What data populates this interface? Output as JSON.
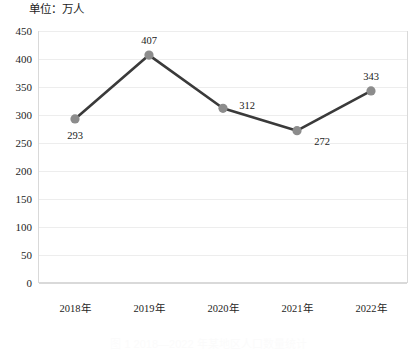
{
  "chart_data": {
    "type": "line",
    "title": "单位：万人",
    "xlabel": "",
    "ylabel": "",
    "categories": [
      "2018年",
      "2019年",
      "2020年",
      "2021年",
      "2022年"
    ],
    "values": [
      293,
      407,
      312,
      272,
      343
    ],
    "point_labels": [
      "293",
      "407",
      "312",
      "272",
      "343"
    ],
    "ylim": [
      0,
      450
    ],
    "ytick_values": [
      450,
      400,
      350,
      300,
      250,
      200,
      150,
      100,
      50,
      0
    ],
    "ytick_labels": [
      "450",
      "400",
      "350",
      "300",
      "250",
      "200",
      "150",
      "100",
      "50",
      "0"
    ],
    "grid": true,
    "legend": "none",
    "line_color": "#3a3a3a",
    "marker_color": "#8c8c8c",
    "gridline_color": "#ededed",
    "axis_color": "#d9d9d9"
  },
  "caption": {
    "text": "图 1  2018—2022 年某地区人口数量统计"
  }
}
